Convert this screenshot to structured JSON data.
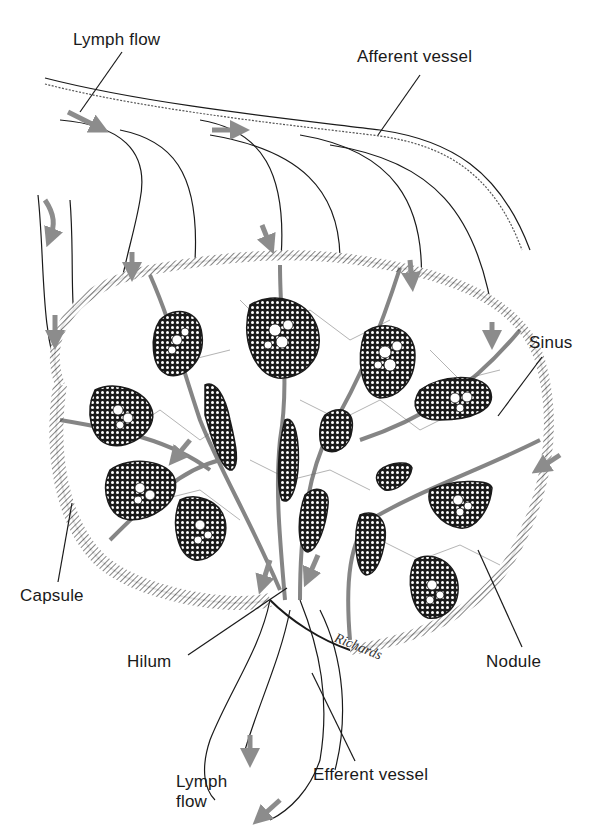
{
  "figure": {
    "signature": "Richards",
    "colors": {
      "ink": "#1a1a1a",
      "hatch": "#555555",
      "arrow": "#8c8c8c",
      "background": "#ffffff"
    }
  },
  "labels": {
    "lymph_flow_top": "Lymph flow",
    "afferent_vessel": "Afferent vessel",
    "sinus": "Sinus",
    "capsule": "Capsule",
    "hilum": "Hilum",
    "nodule": "Nodule",
    "lymph_flow_bottom_line1": "Lymph",
    "lymph_flow_bottom_line2": "flow",
    "efferent_vessel": "Efferent vessel"
  }
}
